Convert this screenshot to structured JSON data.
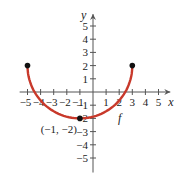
{
  "chart_data": {
    "type": "line",
    "title": "",
    "xlabel": "x",
    "ylabel": "y",
    "xlim": [
      -5.5,
      5.8
    ],
    "ylim": [
      -6,
      5.8
    ],
    "x_ticks": [
      -5,
      -4,
      -3,
      -2,
      -1,
      1,
      2,
      3,
      4,
      5
    ],
    "y_ticks": [
      -5,
      -4,
      -3,
      -2,
      -1,
      1,
      2,
      3,
      4,
      5
    ],
    "x_tick_labels": [
      "−5",
      "−4",
      "−3",
      "−2",
      "−1",
      "1",
      "2",
      "3",
      "4",
      "5"
    ],
    "y_tick_labels": [
      "−5",
      "−4",
      "−3",
      "−2",
      "−1",
      "1",
      "2",
      "3",
      "4",
      "5"
    ],
    "grid": false,
    "series": [
      {
        "name": "f",
        "description": "lower semicircle centered at (-1, 2) with radius 4",
        "color": "#c8392b",
        "x": [
          -5,
          -4,
          -3,
          -2,
          -1,
          0,
          1,
          2,
          3
        ],
        "y": [
          2,
          -0.65,
          -1.46,
          -1.87,
          -2,
          -1.87,
          -1.46,
          -0.65,
          2
        ],
        "endpoints": [
          [
            -5,
            2
          ],
          [
            3,
            2
          ]
        ]
      }
    ],
    "annotations": [
      {
        "text": "(−1, −2)",
        "point": [
          -1,
          -2
        ]
      },
      {
        "text": "f",
        "label_for": "curve"
      }
    ]
  },
  "labels": {
    "x_axis": "x",
    "y_axis": "y",
    "function_name": "f",
    "min_point": "(−1, −2)"
  },
  "colors": {
    "curve": "#c8392b",
    "axis": "#555555",
    "point": "#111111"
  }
}
